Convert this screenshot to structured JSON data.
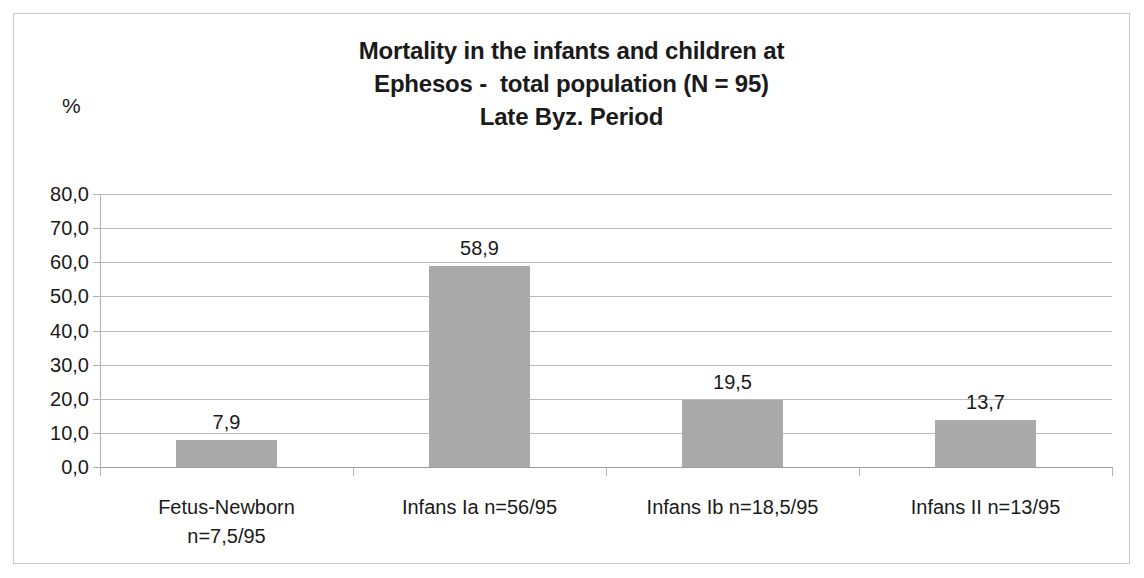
{
  "chart_data": {
    "type": "bar",
    "title": "Mortality in the infants and children at Ephesos -  total population (N = 95) Late Byz. Period",
    "title_lines": [
      "Mortality in the infants and children at",
      "Ephesos -  total population (N = 95)",
      "Late Byz. Period"
    ],
    "categories": [
      "Fetus-Newborn n=7,5/95",
      "Infans Ia n=56/95",
      "Infans Ib n=18,5/95",
      "Infans II n=13/95"
    ],
    "category_lines": [
      [
        "Fetus-Newborn",
        "n=7,5/95"
      ],
      [
        "Infans Ia n=56/95"
      ],
      [
        "Infans Ib n=18,5/95"
      ],
      [
        "Infans II n=13/95"
      ]
    ],
    "values": [
      7.9,
      58.9,
      19.5,
      13.7
    ],
    "value_labels": [
      "7,9",
      "58,9",
      "19,5",
      "13,7"
    ],
    "xlabel": "",
    "ylabel": "%",
    "ylim": [
      0.0,
      80.0
    ],
    "ytick_step": 10.0,
    "ytick_labels": [
      "80,0",
      "70,0",
      "60,0",
      "50,0",
      "40,0",
      "30,0",
      "20,0",
      "10,0",
      "0,0"
    ],
    "ytick_values": [
      80.0,
      70.0,
      60.0,
      50.0,
      40.0,
      30.0,
      20.0,
      10.0,
      0.0
    ],
    "grid": true,
    "legend": false,
    "decimal_separator": ",",
    "colors": {
      "bar_fill": "#aaaaaa",
      "gridline": "#b9b9b9",
      "axis": "#b0b0b0",
      "text": "#1a1a1a",
      "frame_border": "#c9c9c9",
      "background": "#ffffff"
    }
  }
}
